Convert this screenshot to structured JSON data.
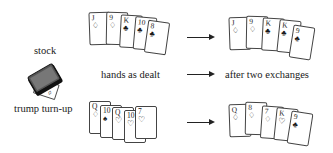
{
  "labels": {
    "stock": "stock",
    "trump_turnup": "trump turn-up",
    "hands_as_dealt": "hands as dealt",
    "after_two_exchanges": "after two exchanges"
  },
  "hands": {
    "top_dealt": [
      {
        "rank": "J",
        "suit": "♢"
      },
      {
        "rank": "9",
        "suit": "♢"
      },
      {
        "rank": "K",
        "suit": "♣"
      },
      {
        "rank": "10",
        "suit": "♣"
      },
      {
        "rank": "8",
        "suit": "♣"
      }
    ],
    "top_after": [
      {
        "rank": "J",
        "suit": "♢"
      },
      {
        "rank": "9",
        "suit": "♢"
      },
      {
        "rank": "K",
        "suit": "♣"
      },
      {
        "rank": "K",
        "suit": "♣"
      },
      {
        "rank": "9",
        "suit": "♣"
      }
    ],
    "bottom_dealt": [
      {
        "rank": "Q",
        "suit": "♢"
      },
      {
        "rank": "10",
        "suit": "♠"
      },
      {
        "rank": "Q",
        "suit": "♡"
      },
      {
        "rank": "10",
        "suit": "♡"
      },
      {
        "rank": "7",
        "suit": "♡"
      }
    ],
    "bottom_after": [
      {
        "rank": "Q",
        "suit": "♢"
      },
      {
        "rank": "8",
        "suit": "♢"
      },
      {
        "rank": "7",
        "suit": "♢"
      },
      {
        "rank": "K",
        "suit": "♡"
      },
      {
        "rank": "9",
        "suit": "♣"
      }
    ]
  },
  "trump_card": {
    "rank": "9",
    "suit": "♢"
  }
}
